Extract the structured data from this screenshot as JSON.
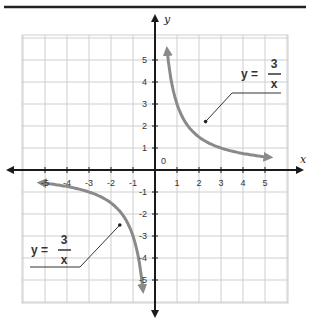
{
  "chart_data": {
    "type": "line",
    "title": "",
    "xlabel": "x",
    "ylabel": "y",
    "xlim": [
      -6.3,
      6.3
    ],
    "ylim": [
      -6.3,
      6.3
    ],
    "grid": true,
    "x_ticks": [
      -5,
      -4,
      -3,
      -2,
      -1,
      1,
      2,
      3,
      4,
      5
    ],
    "y_ticks": [
      -5,
      -4,
      -3,
      -2,
      -1,
      1,
      2,
      3,
      4,
      5
    ],
    "x_tick_labels": [
      "-5",
      "-4",
      "-3",
      "-2",
      "-1",
      "1",
      "2",
      "3",
      "4",
      "5"
    ],
    "y_tick_labels": [
      "-5",
      "-4",
      "-3",
      "-2",
      "-1",
      "1",
      "2",
      "3",
      "4",
      "5"
    ],
    "origin_label": "0",
    "series": [
      {
        "name": "y = 3/x (x > 0)",
        "function": "3/x",
        "x": [
          0.55,
          0.75,
          1,
          1.5,
          2,
          2.5,
          3,
          4,
          5.2
        ],
        "y": [
          5.45,
          4,
          3,
          2,
          1.5,
          1.2,
          1,
          0.75,
          0.58
        ]
      },
      {
        "name": "y = 3/x (x < 0)",
        "function": "3/x",
        "x": [
          -5.2,
          -4,
          -3,
          -2.5,
          -2,
          -1.5,
          -1,
          -0.75,
          -0.55
        ],
        "y": [
          -0.58,
          -0.75,
          -1,
          -1.2,
          -1.5,
          -2,
          -3,
          -4,
          -5.45
        ]
      }
    ],
    "annotations": [
      {
        "text": "y = 3/x",
        "lhs": "y =",
        "numerator": "3",
        "denominator": "x",
        "position": "upper right",
        "points_to": [
          2.3,
          2.2
        ]
      },
      {
        "text": "y = 3/x",
        "lhs": "y =",
        "numerator": "3",
        "denominator": "x",
        "position": "lower left",
        "points_to": [
          -1.6,
          -2.5
        ]
      }
    ],
    "colors": {
      "curve": "#8a8a8a",
      "axes": "#1a1a1a",
      "grid": "#cfcfcf"
    }
  }
}
